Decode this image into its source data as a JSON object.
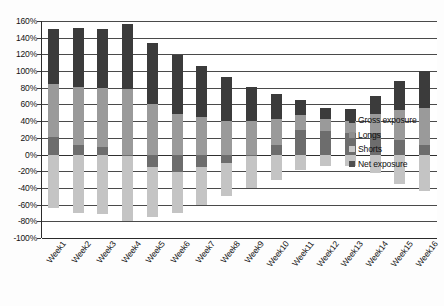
{
  "chart_data": {
    "type": "bar",
    "title": "",
    "subtitle": "",
    "xlabel": "",
    "ylabel": "",
    "ylim": [
      -100,
      160
    ],
    "ytick_step": 20,
    "grid": true,
    "legend_position": "right",
    "categories": [
      "Week1",
      "Week2",
      "Week3",
      "Week4",
      "Week5",
      "Week6",
      "Week7",
      "Week8",
      "Week9",
      "Week10",
      "Week11",
      "Week12",
      "Week13",
      "Week14",
      "Week15",
      "Week16"
    ],
    "ytick_labels": [
      "160%",
      "140%",
      "120%",
      "100%",
      "80%",
      "60%",
      "40%",
      "20%",
      "0%",
      "-20%",
      "-40%",
      "-60%",
      "-80%",
      "-100%"
    ],
    "ytick_values": [
      160,
      140,
      120,
      100,
      80,
      60,
      40,
      20,
      0,
      -20,
      -40,
      -60,
      -80,
      -100
    ],
    "series": [
      {
        "name": "Gross exposure",
        "color": "#3b3b3b",
        "values": [
          150,
          152,
          151,
          157,
          134,
          119,
          106,
          93,
          81,
          72,
          65,
          56,
          54,
          70,
          88,
          100
        ]
      },
      {
        "name": "Longs",
        "color": "#8f8f8f",
        "values": [
          85,
          81,
          80,
          78,
          60,
          49,
          45,
          40,
          40,
          42,
          47,
          42,
          40,
          48,
          53,
          56
        ]
      },
      {
        "name": "Shorts",
        "color": "#cacaca",
        "values": [
          -64,
          -70,
          -71,
          -80,
          -75,
          -70,
          -60,
          -50,
          -40,
          -30,
          -18,
          -14,
          -14,
          -22,
          -35,
          -44
        ]
      },
      {
        "name": "Net exposure",
        "color": "#4f4f4f",
        "values": [
          21,
          11,
          9,
          -2,
          -15,
          -21,
          -15,
          -10,
          0,
          12,
          29,
          28,
          26,
          26,
          18,
          12
        ]
      }
    ]
  },
  "legend": {
    "items": [
      {
        "label": "Gross exposure",
        "swatch": "sw-gross"
      },
      {
        "label": "Longs",
        "swatch": "sw-long"
      },
      {
        "label": "Shorts",
        "swatch": "sw-short"
      },
      {
        "label": "Net exposure",
        "swatch": "sw-net"
      }
    ]
  },
  "caption": {
    "text": ""
  }
}
